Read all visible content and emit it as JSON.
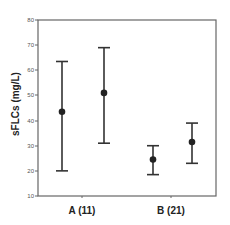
{
  "chart_data": {
    "type": "errorbar",
    "title": "",
    "xlabel": "",
    "ylabel": "sFLCs  (mg/L)",
    "ylim": [
      10,
      80
    ],
    "yticks": [
      10,
      20,
      30,
      40,
      50,
      60,
      70,
      80
    ],
    "grid": false,
    "legend": null,
    "categories": [
      "A (11)",
      "B (21)"
    ],
    "points": [
      {
        "category": "A (11)",
        "index": 0,
        "mean": 43.5,
        "lower": 20,
        "upper": 63.5
      },
      {
        "category": "A (11)",
        "index": 1,
        "mean": 51,
        "lower": 31,
        "upper": 69
      },
      {
        "category": "B (21)",
        "index": 0,
        "mean": 24.5,
        "lower": 18.5,
        "upper": 30
      },
      {
        "category": "B (21)",
        "index": 1,
        "mean": 31.5,
        "lower": 23,
        "upper": 39
      }
    ]
  },
  "labels": {
    "ylabel": "sFLCs  (mg/L)",
    "cat_a": "A (11)",
    "cat_b": "B (21)",
    "ticks": [
      "10",
      "20",
      "30",
      "40",
      "50",
      "60",
      "70",
      "80"
    ]
  },
  "colors": {
    "axis": "#666666",
    "bar": "#333333",
    "marker": "#222222"
  }
}
